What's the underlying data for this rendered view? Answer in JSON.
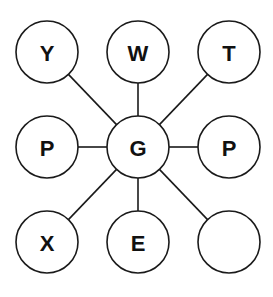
{
  "diagram": {
    "center": {
      "id": "center",
      "label": "G",
      "cx": 138,
      "cy": 147
    },
    "radius": 31,
    "nodes": [
      {
        "id": "top-left",
        "label": "Y",
        "cx": 47,
        "cy": 52
      },
      {
        "id": "top-middle",
        "label": "W",
        "cx": 138,
        "cy": 52
      },
      {
        "id": "top-right",
        "label": "T",
        "cx": 229,
        "cy": 52
      },
      {
        "id": "middle-left",
        "label": "P",
        "cx": 47,
        "cy": 147
      },
      {
        "id": "middle-right",
        "label": "P",
        "cx": 229,
        "cy": 147
      },
      {
        "id": "bottom-left",
        "label": "X",
        "cx": 47,
        "cy": 242
      },
      {
        "id": "bottom-middle",
        "label": "E",
        "cx": 138,
        "cy": 242
      },
      {
        "id": "bottom-right",
        "label": "",
        "cx": 229,
        "cy": 242
      }
    ],
    "colors": {
      "stroke": "#1a1a1a",
      "fill": "#ffffff",
      "text": "#111111"
    }
  }
}
